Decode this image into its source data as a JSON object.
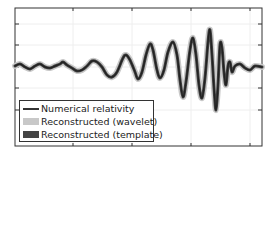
{
  "chart_data": {
    "type": "line",
    "title": "",
    "xlabel": "",
    "ylabel": "",
    "grid": true,
    "legend_position": "lower left",
    "colors": {
      "numerical_relativity": "#2b2b2b",
      "wavelet_band": "#c8c8c8",
      "template": "#444444",
      "frame": "#333333"
    },
    "legend": [
      {
        "label": "Numerical relativity",
        "style": "line"
      },
      {
        "label": "Reconstructed (wavelet)",
        "style": "band-light"
      },
      {
        "label": "Reconstructed (template)",
        "style": "band-dark"
      }
    ],
    "x_ticks_px": [
      73,
      132,
      191,
      250
    ],
    "y_ticks_px": [
      24,
      45,
      67,
      88,
      110
    ],
    "series": [
      {
        "name": "Numerical relativity",
        "points_px": [
          [
            15,
            66
          ],
          [
            20,
            64
          ],
          [
            25,
            67
          ],
          [
            30,
            69
          ],
          [
            35,
            66
          ],
          [
            40,
            64
          ],
          [
            45,
            67
          ],
          [
            50,
            68
          ],
          [
            55,
            66
          ],
          [
            60,
            64
          ],
          [
            63,
            62
          ],
          [
            67,
            65
          ],
          [
            72,
            68
          ],
          [
            77,
            71
          ],
          [
            82,
            70
          ],
          [
            87,
            66
          ],
          [
            92,
            61
          ],
          [
            97,
            62
          ],
          [
            102,
            67
          ],
          [
            107,
            75
          ],
          [
            112,
            77
          ],
          [
            117,
            72
          ],
          [
            123,
            58
          ],
          [
            126,
            55
          ],
          [
            130,
            60
          ],
          [
            135,
            72
          ],
          [
            138,
            79
          ],
          [
            142,
            72
          ],
          [
            146,
            55
          ],
          [
            150,
            44
          ],
          [
            153,
            50
          ],
          [
            157,
            70
          ],
          [
            160,
            78
          ],
          [
            164,
            70
          ],
          [
            168,
            52
          ],
          [
            173,
            42
          ],
          [
            177,
            55
          ],
          [
            180,
            80
          ],
          [
            183,
            97
          ],
          [
            186,
            82
          ],
          [
            190,
            50
          ],
          [
            193,
            38
          ],
          [
            196,
            55
          ],
          [
            199,
            85
          ],
          [
            202,
            98
          ],
          [
            205,
            78
          ],
          [
            208,
            42
          ],
          [
            210,
            30
          ],
          [
            212,
            55
          ],
          [
            214,
            88
          ],
          [
            216,
            110
          ],
          [
            218,
            85
          ],
          [
            220,
            45
          ],
          [
            222,
            48
          ],
          [
            224,
            72
          ],
          [
            226,
            85
          ],
          [
            228,
            66
          ],
          [
            230,
            62
          ],
          [
            232,
            72
          ],
          [
            235,
            66
          ],
          [
            240,
            64
          ],
          [
            245,
            68
          ],
          [
            250,
            70
          ],
          [
            255,
            66
          ],
          [
            262,
            67
          ]
        ]
      }
    ]
  },
  "legend": {
    "items": [
      {
        "label": "Numerical relativity"
      },
      {
        "label": "Reconstructed (wavelet)"
      },
      {
        "label": "Reconstructed (template)"
      }
    ]
  }
}
